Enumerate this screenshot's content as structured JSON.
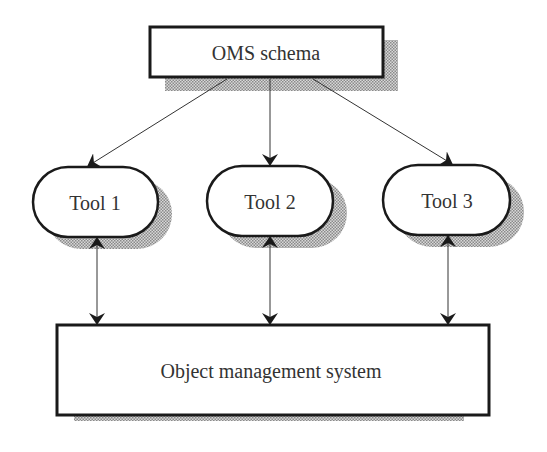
{
  "diagram": {
    "schema_box": {
      "label": "OMS schema"
    },
    "tools": [
      {
        "label": "Tool 1"
      },
      {
        "label": "Tool 2"
      },
      {
        "label": "Tool 3"
      }
    ],
    "oms_box": {
      "label": "Object management system"
    }
  },
  "colors": {
    "stroke": "#1a1a1a",
    "text": "#333333",
    "shadow": "#b5b5b5"
  }
}
